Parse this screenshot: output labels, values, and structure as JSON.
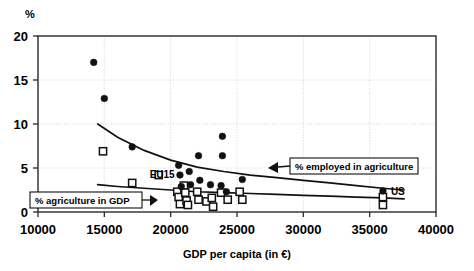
{
  "chart_data": {
    "type": "scatter",
    "title": "",
    "xlabel": "GDP per capita (in €)",
    "ylabel": "",
    "yunit_label": "%",
    "xlim": [
      10000,
      40000
    ],
    "ylim": [
      0,
      20
    ],
    "xticks": [
      10000,
      15000,
      20000,
      25000,
      30000,
      35000,
      40000
    ],
    "xticklabels": [
      "10000",
      "15000",
      "20000",
      "25000",
      "30000",
      "35000",
      "40000"
    ],
    "yticks": [
      0,
      5,
      10,
      15,
      20
    ],
    "yticklabels": [
      "0",
      "5",
      "10",
      "15",
      "20"
    ],
    "grid": true,
    "grid_axis": "y",
    "legend_position": "inline-callouts",
    "series": [
      {
        "name": "% employed in agriculture",
        "marker": "filled-circle",
        "color": "#111111",
        "points": [
          {
            "x": 14200,
            "y": 17.0
          },
          {
            "x": 15000,
            "y": 12.9
          },
          {
            "x": 17100,
            "y": 7.4
          },
          {
            "x": 20600,
            "y": 5.3
          },
          {
            "x": 20700,
            "y": 4.2
          },
          {
            "x": 20800,
            "y": 2.9
          },
          {
            "x": 21400,
            "y": 4.6
          },
          {
            "x": 21500,
            "y": 3.1
          },
          {
            "x": 22100,
            "y": 6.4
          },
          {
            "x": 22200,
            "y": 3.6
          },
          {
            "x": 23000,
            "y": 3.1
          },
          {
            "x": 23900,
            "y": 8.6
          },
          {
            "x": 23900,
            "y": 6.4
          },
          {
            "x": 23800,
            "y": 3.0
          },
          {
            "x": 24200,
            "y": 2.3
          },
          {
            "x": 25400,
            "y": 3.7
          },
          {
            "x": 36000,
            "y": 2.4
          }
        ]
      },
      {
        "name": "% agriculture in GDP",
        "marker": "open-square",
        "color": "#111111",
        "points": [
          {
            "x": 14900,
            "y": 6.9
          },
          {
            "x": 17100,
            "y": 3.3
          },
          {
            "x": 19100,
            "y": 4.2
          },
          {
            "x": 20500,
            "y": 2.3
          },
          {
            "x": 20600,
            "y": 1.7
          },
          {
            "x": 20700,
            "y": 0.9
          },
          {
            "x": 21000,
            "y": 3.0
          },
          {
            "x": 21100,
            "y": 2.2
          },
          {
            "x": 21200,
            "y": 1.3
          },
          {
            "x": 21300,
            "y": 0.8
          },
          {
            "x": 22000,
            "y": 2.3
          },
          {
            "x": 22100,
            "y": 1.4
          },
          {
            "x": 22700,
            "y": 1.2
          },
          {
            "x": 23100,
            "y": 1.6
          },
          {
            "x": 23200,
            "y": 0.6
          },
          {
            "x": 23800,
            "y": 2.2
          },
          {
            "x": 24300,
            "y": 1.4
          },
          {
            "x": 25200,
            "y": 2.3
          },
          {
            "x": 25400,
            "y": 1.4
          },
          {
            "x": 36000,
            "y": 1.7
          },
          {
            "x": 36000,
            "y": 0.8
          }
        ]
      }
    ],
    "trendlines": [
      {
        "name": "% employed in agriculture trend",
        "points": [
          {
            "x": 14500,
            "y": 10.0
          },
          {
            "x": 16000,
            "y": 8.5
          },
          {
            "x": 18000,
            "y": 7.0
          },
          {
            "x": 20000,
            "y": 5.9
          },
          {
            "x": 22000,
            "y": 5.1
          },
          {
            "x": 24000,
            "y": 4.6
          },
          {
            "x": 26000,
            "y": 4.2
          },
          {
            "x": 28000,
            "y": 3.9
          },
          {
            "x": 30000,
            "y": 3.6
          },
          {
            "x": 32000,
            "y": 3.3
          },
          {
            "x": 34000,
            "y": 3.0
          },
          {
            "x": 36000,
            "y": 2.7
          },
          {
            "x": 37600,
            "y": 2.5
          }
        ]
      },
      {
        "name": "% agriculture in GDP trend",
        "points": [
          {
            "x": 14500,
            "y": 3.1
          },
          {
            "x": 16000,
            "y": 2.9
          },
          {
            "x": 18000,
            "y": 2.7
          },
          {
            "x": 20000,
            "y": 2.5
          },
          {
            "x": 22000,
            "y": 2.3
          },
          {
            "x": 24000,
            "y": 2.2
          },
          {
            "x": 26000,
            "y": 2.1
          },
          {
            "x": 28000,
            "y": 2.0
          },
          {
            "x": 30000,
            "y": 1.9
          },
          {
            "x": 32000,
            "y": 1.8
          },
          {
            "x": 34000,
            "y": 1.7
          },
          {
            "x": 36000,
            "y": 1.6
          },
          {
            "x": 37600,
            "y": 1.5
          }
        ]
      }
    ],
    "annotations": [
      {
        "name": "eu15-label",
        "text": "EU15",
        "x": 20300,
        "y": 3.9
      },
      {
        "name": "us-label",
        "text": "US",
        "x": 36600,
        "y": 1.9
      }
    ],
    "callouts": [
      {
        "name": "agriculture-in-gdp-callout",
        "text": "% agriculture in GDP",
        "arrow_direction": "right"
      },
      {
        "name": "employed-in-agriculture-callout",
        "text": "% employed in agriculture",
        "arrow_direction": "left"
      }
    ]
  }
}
